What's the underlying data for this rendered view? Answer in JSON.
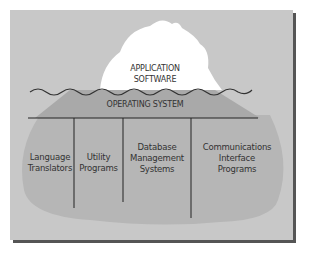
{
  "diagram": {
    "type": "iceberg",
    "tip": {
      "line1": "APPLICATION",
      "line2": "SOFTWARE"
    },
    "middle": {
      "label": "OPERATING SYSTEM"
    },
    "base": [
      {
        "line1": "Language",
        "line2": "Translators",
        "line3": ""
      },
      {
        "line1": "Utility",
        "line2": "Programs",
        "line3": ""
      },
      {
        "line1": "Database",
        "line2": "Management",
        "line3": "Systems"
      },
      {
        "line1": "Communications",
        "line2": "Interface",
        "line3": "Programs"
      }
    ],
    "colors": {
      "background": "#c8c8c8",
      "tip": "#ffffff",
      "os_band": "#a9a9a9",
      "base": "#b6b6b6",
      "shadow": "#555555",
      "text": "#333333"
    }
  }
}
